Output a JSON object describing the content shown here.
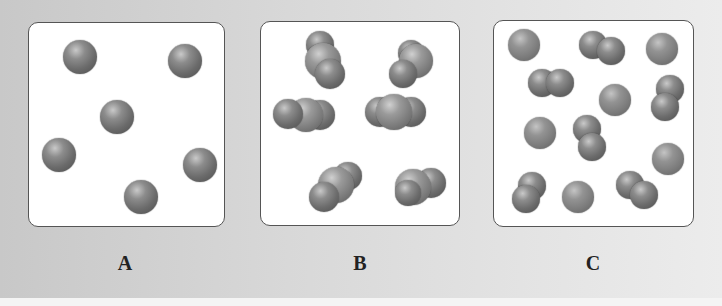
{
  "figure": {
    "panels": [
      {
        "label": "A",
        "description": "six separate single atoms",
        "particle_type": "atom",
        "count": 6
      },
      {
        "label": "B",
        "description": "six diatomic molecules composed of two different atoms (space-filling)",
        "particle_type": "diatomic molecule",
        "count": 6
      },
      {
        "label": "C",
        "description": "mixture of single atoms and diatomic molecules",
        "particle_type": "mixture",
        "atoms": 7,
        "molecules": 5
      }
    ]
  },
  "colors": {
    "background": "#d6d6d6",
    "box_fill": "#ffffff",
    "box_border": "#555555",
    "atom_gray": "#6b6b6b",
    "atom_light": "#9a9a9a"
  }
}
